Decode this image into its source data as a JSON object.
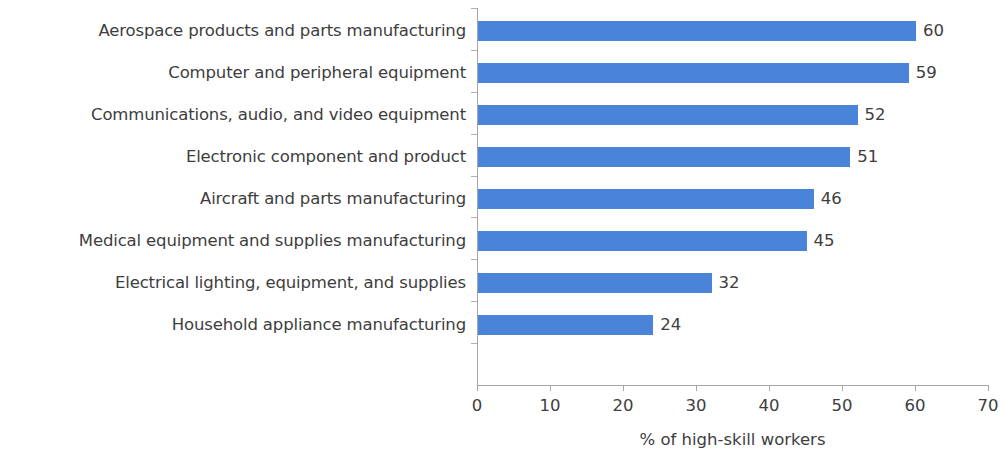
{
  "chart_data": {
    "type": "bar",
    "orientation": "horizontal",
    "title": "",
    "xlabel": "% of high-skill workers",
    "ylabel": "",
    "xlim": [
      0,
      70
    ],
    "xticks": [
      0,
      10,
      20,
      30,
      40,
      50,
      60,
      70
    ],
    "grid": false,
    "legend": null,
    "bar_color": "#4a84d8",
    "text_color": "#3d3d3d",
    "axis_color": "#a6a6a6",
    "categories": [
      "Aerospace products and parts manufacturing",
      "Computer and peripheral equipment",
      "Communications, audio, and video equipment",
      "Electronic component and product",
      "Aircraft and parts manufacturing",
      "Medical equipment and supplies manufacturing",
      "Electrical lighting, equipment, and supplies",
      "Household appliance manufacturing"
    ],
    "values": [
      60,
      59,
      52,
      51,
      46,
      45,
      32,
      24
    ],
    "value_labels": [
      "60",
      "59",
      "52",
      "51",
      "46",
      "45",
      "32",
      "24"
    ],
    "xtick_labels": [
      "0",
      "10",
      "20",
      "30",
      "40",
      "50",
      "60",
      "70"
    ]
  }
}
